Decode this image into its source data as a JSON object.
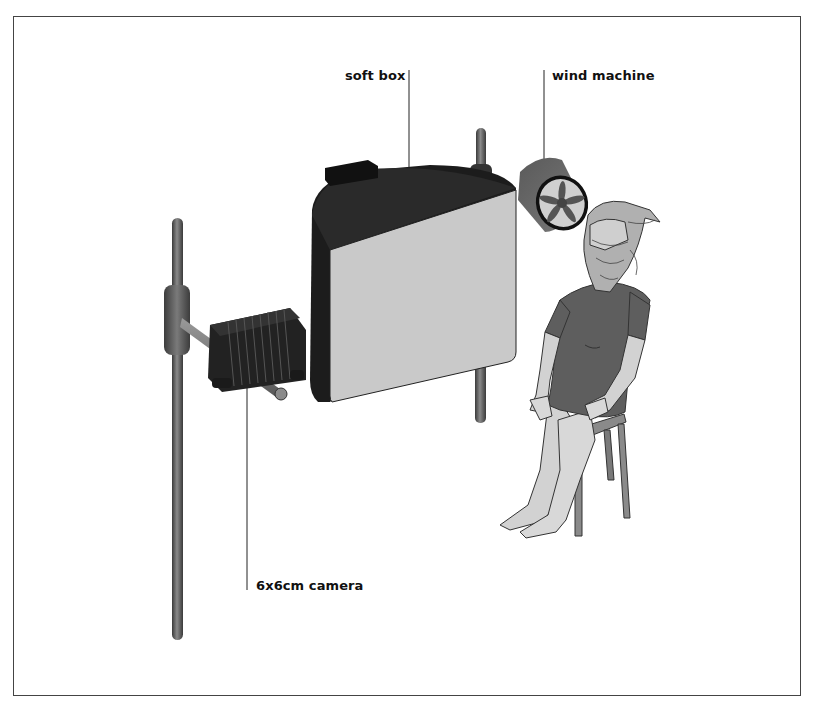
{
  "diagram": {
    "type": "lighting-setup-illustration",
    "labels": {
      "soft_box": "soft box",
      "wind_machine": "wind machine",
      "camera": "6x6cm camera"
    },
    "components": [
      {
        "name": "soft box",
        "description": "large square diffuser on a stand, dark housing"
      },
      {
        "name": "wind machine",
        "description": "cylindrical fan with five blades pointing at subject"
      },
      {
        "name": "6x6cm camera",
        "description": "bellows camera mounted on horizontal arm of a vertical stand"
      },
      {
        "name": "model",
        "description": "seated figure on a stool, hair blown across face"
      },
      {
        "name": "stool",
        "description": "four-legged wooden stool"
      }
    ],
    "colors": {
      "frame": "#444444",
      "softbox_front": "#c8c8c8",
      "softbox_housing": "#1e1e1e",
      "stand": "#6a6a6a",
      "clothing": "#5e5e5e",
      "skin": "#d2d2d2",
      "hair": "#a8a8a8"
    }
  }
}
